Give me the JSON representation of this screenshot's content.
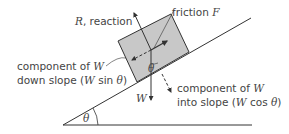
{
  "diagram": {
    "angle_label": "θ",
    "labels": {
      "reaction_prefix": "R",
      "reaction_suffix": ", reaction",
      "friction_prefix": "friction ",
      "friction_var": "F",
      "weight": "W",
      "down_slope_line1_prefix": "component of ",
      "down_slope_line1_var": "W",
      "down_slope_line2_prefix": "down slope (",
      "down_slope_line2_var": "W",
      "down_slope_line2_mid": " sin ",
      "down_slope_line2_theta": "θ",
      "down_slope_line2_suffix": ")",
      "into_slope_line1_prefix": "component of ",
      "into_slope_line1_var": "W",
      "into_slope_line2_prefix": "into slope (",
      "into_slope_line2_var": "W",
      "into_slope_line2_mid": " cos ",
      "into_slope_line2_theta": "θ",
      "into_slope_line2_suffix": ")",
      "box_angle": "θ"
    },
    "colors": {
      "line": "#333333",
      "box_fill": "#c8c8c8",
      "text": "#444444"
    }
  }
}
